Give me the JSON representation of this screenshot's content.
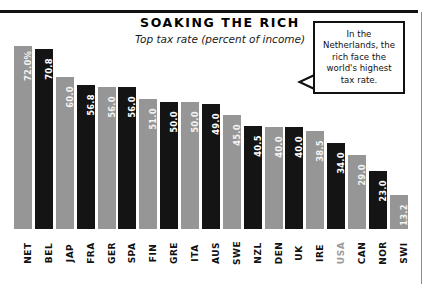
{
  "chart_data": {
    "type": "bar",
    "title": "SOAKING THE RICH",
    "subtitle": "Top tax rate (percent of income)",
    "xlabel": "",
    "ylabel": "",
    "ylim": [
      0,
      72
    ],
    "grid": false,
    "legend": "none",
    "categories": [
      "NET",
      "BEL",
      "JAP",
      "FRA",
      "GER",
      "SPA",
      "FIN",
      "GRE",
      "ITA",
      "AUS",
      "SWE",
      "NZL",
      "DEN",
      "UK",
      "IRE",
      "USA",
      "CAN",
      "NOR",
      "SWI"
    ],
    "values": [
      72.0,
      70.8,
      60.0,
      56.8,
      56.0,
      56.0,
      51.0,
      50.0,
      50.0,
      49.0,
      45.0,
      40.5,
      40.0,
      40.0,
      38.5,
      34.0,
      29.0,
      23.0,
      13.2
    ],
    "value_labels": [
      "72.0%",
      "70.8",
      "60.0",
      "56.8",
      "56.0",
      "56.0",
      "51.0",
      "50.0",
      "50.0",
      "49.0",
      "45.0",
      "40.5",
      "40.0",
      "40.0",
      "38.5",
      "34.0",
      "29.0",
      "23.0",
      "13.2"
    ],
    "bar_styles": [
      "light",
      "dark",
      "light",
      "dark",
      "light",
      "dark",
      "light",
      "dark",
      "light",
      "dark",
      "light",
      "dark",
      "light",
      "dark",
      "light",
      "dark",
      "light",
      "dark",
      "light"
    ],
    "colors": {
      "bar_dark": "#141414",
      "bar_light": "#969696",
      "value_text": "#ffffff",
      "axis_text": "#111111",
      "rule": "#111111"
    },
    "annotation": {
      "text": "In the Netherlands, the rich face the world's highest tax rate.",
      "target_category": "NET"
    }
  }
}
